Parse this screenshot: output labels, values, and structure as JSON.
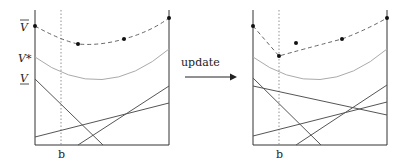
{
  "labels": {
    "v_bar": "V",
    "v_star": "V*",
    "v_under": "V",
    "b_left": "b",
    "b_right": "b",
    "arrow": "update"
  },
  "colors": {
    "axis": "#333333",
    "line": "#555555",
    "curve": "#aaaaaa",
    "dashed": "#666666",
    "point": "#111111"
  },
  "left_panel": {
    "points": [
      [
        35,
        26
      ],
      [
        78,
        44
      ],
      [
        124,
        39
      ],
      [
        169,
        18
      ]
    ],
    "curve": "M35,57 Q102,106 169,49"
  },
  "right_panel": {
    "points": [
      [
        253,
        26
      ],
      [
        279,
        56
      ],
      [
        296,
        43
      ],
      [
        342,
        39
      ],
      [
        387,
        18
      ]
    ],
    "curve": "M253,57 Q320,106 387,49"
  }
}
